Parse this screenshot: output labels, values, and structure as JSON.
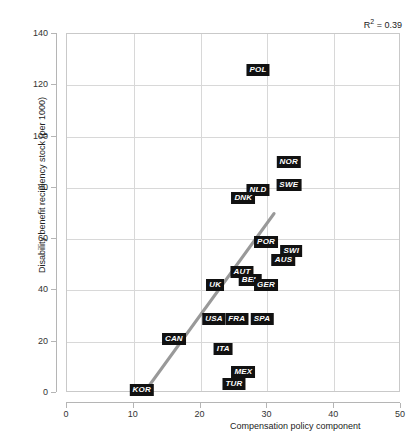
{
  "chart_data": {
    "type": "scatter",
    "title": "",
    "xlabel": "Compensation policy component",
    "ylabel": "Disability benefit recipiency stock (per 1000)",
    "xlim": [
      0,
      50
    ],
    "ylim": [
      0,
      140
    ],
    "xticks": [
      0,
      10,
      20,
      30,
      40,
      50
    ],
    "yticks": [
      0,
      20,
      40,
      60,
      80,
      100,
      120,
      140
    ],
    "grid": true,
    "legend": "none",
    "annotations": [
      {
        "name": "r-squared",
        "text": "R2 = 0.39",
        "r_value": 0.39
      }
    ],
    "trendline": {
      "type": "linear",
      "color": "#999999",
      "x_start": 11.5,
      "y_start": 0,
      "x_end": 31.0,
      "y_end": 70.0
    },
    "points": [
      {
        "label": "POL",
        "x": 28.6,
        "y": 126.0
      },
      {
        "label": "NOR",
        "x": 33.2,
        "y": 90.0
      },
      {
        "label": "SWE",
        "x": 33.2,
        "y": 81.0
      },
      {
        "label": "NLD",
        "x": 28.6,
        "y": 79.0
      },
      {
        "label": "DNK",
        "x": 26.4,
        "y": 76.0
      },
      {
        "label": "POR",
        "x": 29.8,
        "y": 59.0
      },
      {
        "label": "SWI",
        "x": 33.6,
        "y": 55.5
      },
      {
        "label": "AUS",
        "x": 32.4,
        "y": 52.0
      },
      {
        "label": "AUT",
        "x": 26.2,
        "y": 47.0
      },
      {
        "label": "BEL",
        "x": 27.4,
        "y": 44.0
      },
      {
        "label": "GER",
        "x": 29.8,
        "y": 42.0
      },
      {
        "label": "UK",
        "x": 22.2,
        "y": 42.0
      },
      {
        "label": "USA",
        "x": 22.0,
        "y": 29.0
      },
      {
        "label": "FRA",
        "x": 25.4,
        "y": 29.0
      },
      {
        "label": "SPA",
        "x": 29.2,
        "y": 29.0
      },
      {
        "label": "CAN",
        "x": 16.0,
        "y": 21.0
      },
      {
        "label": "ITA",
        "x": 23.4,
        "y": 17.0
      },
      {
        "label": "MEX",
        "x": 26.4,
        "y": 8.0
      },
      {
        "label": "TUR",
        "x": 25.0,
        "y": 3.5
      },
      {
        "label": "KOR",
        "x": 11.2,
        "y": 1.0
      }
    ],
    "colors": {
      "label_background": "#111111",
      "label_text": "#ffffff",
      "trendline": "#999999",
      "gridline": "#d8d8d8",
      "axis": "#b5b5b5",
      "background": "#ffffff"
    }
  }
}
